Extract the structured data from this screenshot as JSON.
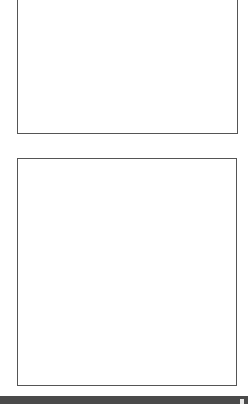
{
  "panels": [
    {
      "name": "top-panel",
      "content": ""
    },
    {
      "name": "bottom-panel",
      "content": ""
    }
  ],
  "bottom_bar": {
    "color": "#4a4a4a",
    "handle_icon": "resize-handle-icon"
  },
  "colors": {
    "background": "#ffffff",
    "panel_border": "#555555"
  }
}
